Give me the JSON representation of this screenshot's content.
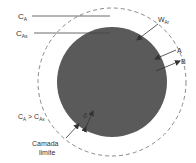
{
  "diagram": {
    "labels": {
      "ca": {
        "main": "C",
        "sub": "A"
      },
      "cas": {
        "main": "C",
        "sub": "As"
      },
      "war": {
        "main": "W",
        "sub": "Ar"
      },
      "a": "A",
      "b": "B",
      "comparison": {
        "left_main": "C",
        "left_sub": "A",
        "op": " > ",
        "right_main": "C",
        "right_sub": "As"
      },
      "delta": "δ",
      "boundary_layer_line1": "Camada",
      "boundary_layer_line2": "limite"
    },
    "colors": {
      "particle": "#5a5a5a",
      "dashed": "#8a8a8a",
      "line": "#444444",
      "text": "#333333"
    }
  }
}
